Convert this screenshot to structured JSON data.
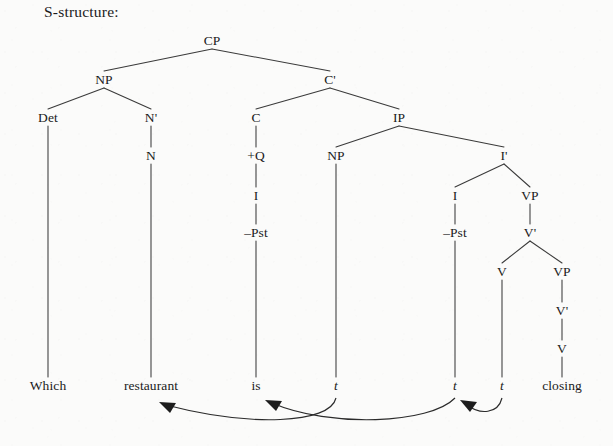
{
  "caption": "S-structure:",
  "colors": {
    "background": "#fbfbfa",
    "ink": "#1a1a1a",
    "edge": "#3a3a3a",
    "arrow": "#1d1d1d"
  },
  "tree": {
    "sentence": "Which restaurant is closing",
    "nodes": [
      {
        "id": "CP",
        "label": "CP",
        "x": 212,
        "y": 41,
        "italic": false
      },
      {
        "id": "NP1",
        "label": "NP",
        "x": 104,
        "y": 80,
        "italic": false
      },
      {
        "id": "Cbar",
        "label": "C'",
        "x": 330,
        "y": 80,
        "italic": false
      },
      {
        "id": "Det",
        "label": "Det",
        "x": 48,
        "y": 118,
        "italic": false
      },
      {
        "id": "Nbar",
        "label": "N'",
        "x": 151,
        "y": 118,
        "italic": false
      },
      {
        "id": "C",
        "label": "C",
        "x": 256,
        "y": 118,
        "italic": false
      },
      {
        "id": "IP",
        "label": "IP",
        "x": 399,
        "y": 118,
        "italic": false
      },
      {
        "id": "N",
        "label": "N",
        "x": 151,
        "y": 156,
        "italic": false
      },
      {
        "id": "plusQ",
        "label": "+Q",
        "x": 256,
        "y": 156,
        "italic": false
      },
      {
        "id": "NP2",
        "label": "NP",
        "x": 336,
        "y": 156,
        "italic": false
      },
      {
        "id": "Ibar",
        "label": "I'",
        "x": 504,
        "y": 156,
        "italic": false
      },
      {
        "id": "I1",
        "label": "I",
        "x": 256,
        "y": 196,
        "italic": false
      },
      {
        "id": "I2",
        "label": "I",
        "x": 455,
        "y": 196,
        "italic": false
      },
      {
        "id": "VP1",
        "label": "VP",
        "x": 530,
        "y": 196,
        "italic": false
      },
      {
        "id": "negPst1",
        "label": "–Pst",
        "x": 256,
        "y": 233,
        "italic": false
      },
      {
        "id": "negPst2",
        "label": "–Pst",
        "x": 455,
        "y": 233,
        "italic": false
      },
      {
        "id": "Vbar1",
        "label": "V'",
        "x": 530,
        "y": 233,
        "italic": false
      },
      {
        "id": "V1",
        "label": "V",
        "x": 502,
        "y": 272,
        "italic": false
      },
      {
        "id": "VP2",
        "label": "VP",
        "x": 562,
        "y": 272,
        "italic": false
      },
      {
        "id": "Vbar2",
        "label": "V'",
        "x": 562,
        "y": 311,
        "italic": false
      },
      {
        "id": "V2",
        "label": "V",
        "x": 562,
        "y": 349,
        "italic": false
      },
      {
        "id": "w_which",
        "label": "Which",
        "x": 48,
        "y": 386,
        "italic": false
      },
      {
        "id": "w_restaurant",
        "label": "restaurant",
        "x": 151,
        "y": 386,
        "italic": false
      },
      {
        "id": "w_is",
        "label": "is",
        "x": 256,
        "y": 386,
        "italic": false
      },
      {
        "id": "t1",
        "label": "t",
        "x": 336,
        "y": 386,
        "italic": true
      },
      {
        "id": "t2",
        "label": "t",
        "x": 455,
        "y": 386,
        "italic": true
      },
      {
        "id": "t3",
        "label": "t",
        "x": 502,
        "y": 386,
        "italic": true
      },
      {
        "id": "w_closing",
        "label": "closing",
        "x": 562,
        "y": 386,
        "italic": false
      }
    ],
    "edges": [
      {
        "from": "CP",
        "to": "NP1"
      },
      {
        "from": "CP",
        "to": "Cbar"
      },
      {
        "from": "NP1",
        "to": "Det"
      },
      {
        "from": "NP1",
        "to": "Nbar"
      },
      {
        "from": "Cbar",
        "to": "C"
      },
      {
        "from": "Cbar",
        "to": "IP"
      },
      {
        "from": "Nbar",
        "to": "N"
      },
      {
        "from": "C",
        "to": "plusQ"
      },
      {
        "from": "IP",
        "to": "NP2"
      },
      {
        "from": "IP",
        "to": "Ibar"
      },
      {
        "from": "plusQ",
        "to": "I1"
      },
      {
        "from": "Ibar",
        "to": "I2"
      },
      {
        "from": "Ibar",
        "to": "VP1"
      },
      {
        "from": "I1",
        "to": "negPst1"
      },
      {
        "from": "I2",
        "to": "negPst2"
      },
      {
        "from": "VP1",
        "to": "Vbar1"
      },
      {
        "from": "Vbar1",
        "to": "V1"
      },
      {
        "from": "Vbar1",
        "to": "VP2"
      },
      {
        "from": "VP2",
        "to": "Vbar2"
      },
      {
        "from": "Vbar2",
        "to": "V2"
      },
      {
        "from": "Det",
        "to": "w_which"
      },
      {
        "from": "N",
        "to": "w_restaurant"
      },
      {
        "from": "negPst1",
        "to": "w_is"
      },
      {
        "from": "NP2",
        "to": "t1"
      },
      {
        "from": "negPst2",
        "to": "t2"
      },
      {
        "from": "V1",
        "to": "t3"
      },
      {
        "from": "V2",
        "to": "w_closing"
      }
    ],
    "movements": [
      {
        "id": "wh-movement",
        "from": "t1",
        "to": "w_restaurant",
        "label": "wh-movement",
        "path": "M 336 398 C 330 424 250 427 166 405",
        "head": {
          "tip": [
            159,
            402
          ],
          "points": "159,402 176,403 170,413"
        }
      },
      {
        "id": "i-to-c-movement",
        "from": "t2",
        "to": "w_is",
        "label": "I-to-C movement",
        "path": "M 455 398 C 430 424 330 428 272 403",
        "head": {
          "tip": [
            265,
            400
          ],
          "points": "265,400 282,401 276,411"
        }
      },
      {
        "id": "v-to-i-movement",
        "from": "t3",
        "to": "t2",
        "label": "V-to-I movement",
        "path": "M 502 398 C 498 414 480 415 467 405",
        "head": {
          "tip": [
            460,
            400
          ],
          "points": "460,400 477,402 470,412"
        }
      }
    ]
  }
}
